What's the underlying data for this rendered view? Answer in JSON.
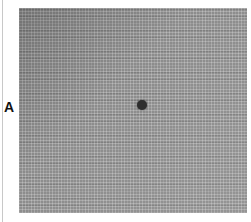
{
  "figure": {
    "panel_label": "A",
    "panel": {
      "background_color": "#8c8c8c",
      "texture": "fine-grid",
      "marker": {
        "shape": "dot",
        "color": "#2e2e2e"
      }
    }
  }
}
